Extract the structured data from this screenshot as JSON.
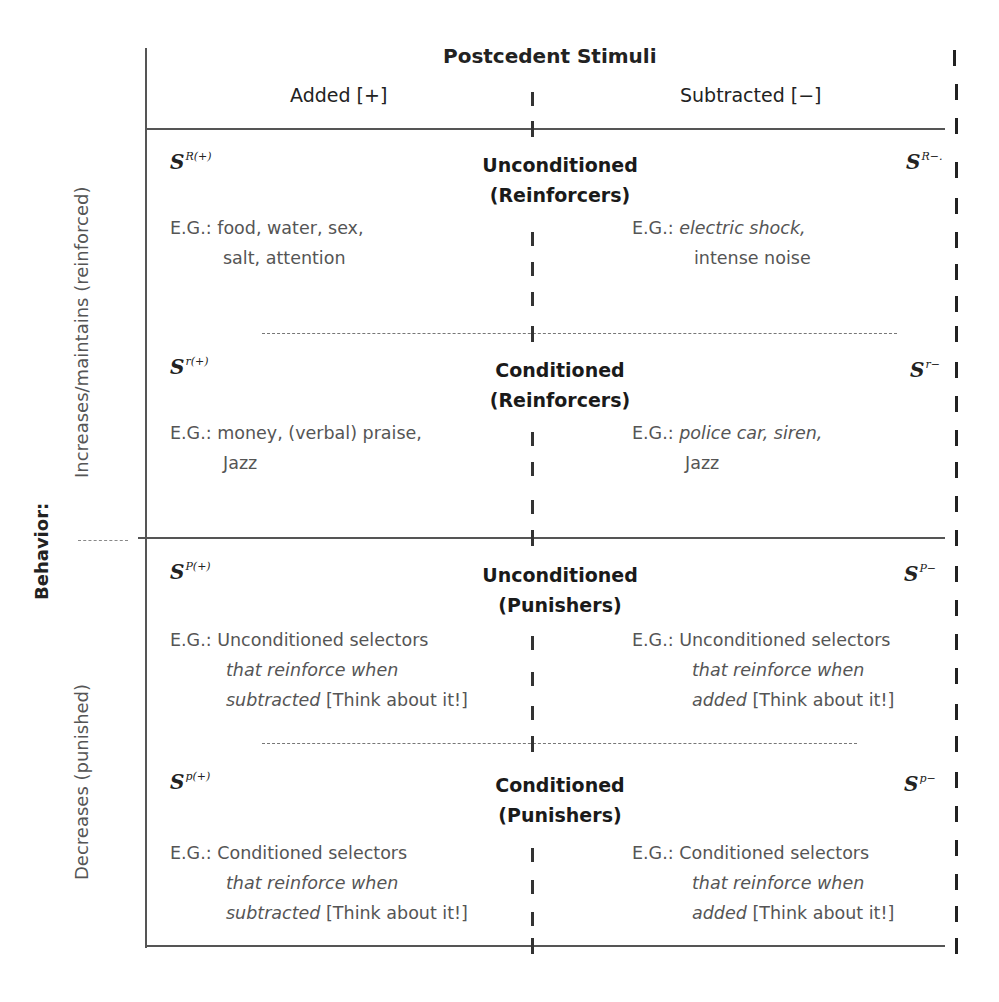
{
  "header": {
    "title": "Postcedent Stimuli",
    "columns": [
      {
        "label": "Added [+]"
      },
      {
        "label": "Subtracted [−]"
      }
    ]
  },
  "row_axis": {
    "label": "Behavior:",
    "top_label": "Increases/maintains (reinforced)",
    "bottom_label": "Decreases (punished)"
  },
  "cells": [
    {
      "category": "Unconditioned",
      "category_sub": "(Reinforcers)",
      "left_symbol": {
        "base": "S",
        "sup": "R(+)"
      },
      "right_symbol": {
        "base": "S",
        "sup": "R−."
      },
      "left_example": {
        "prefix": "E.G.:",
        "line1": "food, water, sex,",
        "line2": "salt, attention",
        "line2_italic": "",
        "line3": "",
        "line3_italic": ""
      },
      "right_example": {
        "prefix": "E.G.:",
        "line1": "electric shock,",
        "line2": "intense noise",
        "line2_italic": "",
        "line3": "",
        "line3_italic": ""
      }
    },
    {
      "category": "Conditioned",
      "category_sub": "(Reinforcers)",
      "left_symbol": {
        "base": "S",
        "sup": "r(+)"
      },
      "right_symbol": {
        "base": "S",
        "sup": "r−"
      },
      "left_example": {
        "prefix": "E.G.:",
        "line1": "money, (verbal) praise,",
        "line2": "Jazz",
        "line2_italic": "",
        "line3": "",
        "line3_italic": ""
      },
      "right_example": {
        "prefix": "E.G.:",
        "line1": "police car, siren,",
        "line2": "Jazz",
        "line2_italic": "",
        "line3": "",
        "line3_italic": ""
      }
    },
    {
      "category": "Unconditioned",
      "category_sub": "(Punishers)",
      "left_symbol": {
        "base": "S",
        "sup": "P(+)"
      },
      "right_symbol": {
        "base": "S",
        "sup": "P−"
      },
      "left_example": {
        "prefix": "E.G.:",
        "line1": "Unconditioned selectors",
        "line2": "",
        "line2_italic": "that reinforce when",
        "line3": "[Think about it!]",
        "line3_italic": "subtracted"
      },
      "right_example": {
        "prefix": "E.G.:",
        "line1": "Unconditioned selectors",
        "line2": "",
        "line2_italic": "that reinforce when",
        "line3": "[Think about it!]",
        "line3_italic": "added"
      }
    },
    {
      "category": "Conditioned",
      "category_sub": "(Punishers)",
      "left_symbol": {
        "base": "S",
        "sup": "p(+)"
      },
      "right_symbol": {
        "base": "S",
        "sup": "p−"
      },
      "left_example": {
        "prefix": "E.G.:",
        "line1": "Conditioned selectors",
        "line2": "",
        "line2_italic": "that reinforce when",
        "line3": "[Think about it!]",
        "line3_italic": "subtracted"
      },
      "right_example": {
        "prefix": "E.G.:",
        "line1": "Conditioned selectors",
        "line2": "",
        "line2_italic": "that reinforce when",
        "line3": "[Think about it!]",
        "line3_italic": "added"
      }
    }
  ]
}
